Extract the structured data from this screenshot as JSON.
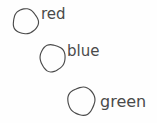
{
  "drawing": {
    "title": "hand-drawn color labels sketch",
    "background_color": "#fefefe",
    "ink_color": "#4a4a4a",
    "width": 157,
    "height": 123,
    "style": "handwritten pencil sketch",
    "items": [
      {
        "id": "red",
        "label": "red",
        "shape": "circle",
        "circle": {
          "cx": 25.5,
          "cy": 21.5,
          "rx": 12.5,
          "ry": 12.5
        },
        "label_pos": {
          "x": 41,
          "y": 19,
          "size": 15
        }
      },
      {
        "id": "blue",
        "label": "blue",
        "shape": "circle",
        "circle": {
          "cx": 52.5,
          "cy": 58.0,
          "rx": 12.5,
          "ry": 13.5
        },
        "label_pos": {
          "x": 67,
          "y": 56,
          "size": 15
        }
      },
      {
        "id": "green",
        "label": "green",
        "shape": "circle",
        "circle": {
          "cx": 81.5,
          "cy": 101.0,
          "rx": 13.5,
          "ry": 14.0
        },
        "label_pos": {
          "x": 100,
          "y": 107,
          "size": 16
        }
      }
    ]
  }
}
